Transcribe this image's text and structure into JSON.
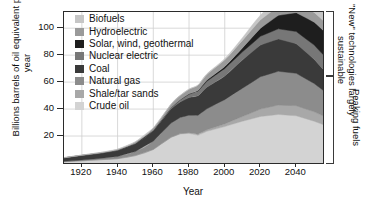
{
  "chart_data": {
    "type": "area",
    "stacked": true,
    "title": "",
    "xlabel": "Year",
    "ylabel": "Billions barrels of oil equivalent per year",
    "xlim": [
      1910,
      2055
    ],
    "ylim": [
      0,
      112
    ],
    "xticks": [
      1920,
      1940,
      1960,
      1980,
      2000,
      2020,
      2040
    ],
    "yticks": [
      20,
      40,
      60,
      80,
      100
    ],
    "grid": true,
    "legend_position": "inside-top-left",
    "x": [
      1910,
      1920,
      1930,
      1940,
      1950,
      1960,
      1970,
      1975,
      1980,
      1985,
      1990,
      2000,
      2010,
      2020,
      2030,
      2040,
      2050,
      2055
    ],
    "series": [
      {
        "name": "Crude oil",
        "color": "#d3d3d3",
        "values": [
          1.0,
          1.6,
          2.4,
          3.2,
          5.5,
          10.0,
          19.0,
          21.5,
          22.0,
          20.5,
          23.5,
          27.0,
          31.0,
          34.5,
          36.0,
          35.0,
          31.0,
          28.5
        ]
      },
      {
        "name": "Shale/tar sands",
        "color": "#a8a8a8",
        "values": [
          0.0,
          0.0,
          0.0,
          0.0,
          0.0,
          0.1,
          0.2,
          0.3,
          0.5,
          0.8,
          1.2,
          2.0,
          3.5,
          5.5,
          7.0,
          7.5,
          7.0,
          6.5
        ]
      },
      {
        "name": "Natural gas",
        "color": "#8c8c8c",
        "values": [
          0.3,
          0.6,
          1.0,
          1.6,
          3.0,
          6.0,
          10.5,
          12.0,
          13.0,
          14.0,
          15.5,
          18.0,
          21.0,
          24.0,
          25.0,
          24.0,
          21.0,
          19.0
        ]
      },
      {
        "name": "Coal",
        "color": "#3a3a3a",
        "values": [
          2.5,
          3.4,
          3.8,
          4.6,
          6.0,
          8.0,
          10.5,
          11.5,
          13.0,
          14.5,
          16.0,
          17.5,
          21.0,
          23.5,
          24.0,
          22.0,
          18.0,
          15.5
        ]
      },
      {
        "name": "Nuclear electric",
        "color": "#777777",
        "values": [
          0.0,
          0.0,
          0.0,
          0.0,
          0.0,
          0.1,
          0.8,
          1.5,
          2.5,
          3.5,
          4.5,
          5.5,
          6.0,
          6.5,
          7.5,
          9.0,
          10.5,
          11.0
        ]
      },
      {
        "name": "Solar, wind, geothermal",
        "color": "#1e1e1e",
        "values": [
          0.0,
          0.0,
          0.0,
          0.0,
          0.0,
          0.0,
          0.1,
          0.2,
          0.3,
          0.5,
          0.8,
          1.5,
          3.0,
          6.0,
          10.0,
          14.0,
          17.0,
          18.0
        ]
      },
      {
        "name": "Hydroelectric",
        "color": "#9a9a9a",
        "values": [
          0.2,
          0.3,
          0.5,
          0.8,
          1.2,
          1.8,
          2.6,
          3.0,
          3.4,
          3.8,
          4.2,
          5.0,
          5.6,
          6.2,
          6.6,
          7.0,
          7.2,
          7.3
        ]
      },
      {
        "name": "Biofuels",
        "color": "#c6c6c6",
        "values": [
          0.0,
          0.0,
          0.0,
          0.0,
          0.0,
          0.0,
          0.0,
          0.1,
          0.2,
          0.3,
          0.5,
          1.0,
          2.0,
          3.5,
          5.0,
          6.0,
          6.5,
          6.8
        ]
      }
    ]
  },
  "legend": {
    "items": [
      {
        "label": "Biofuels",
        "color": "#c6c6c6"
      },
      {
        "label": "Hydroelectric",
        "color": "#9a9a9a"
      },
      {
        "label": "Solar, wind, geothermal",
        "color": "#1e1e1e"
      },
      {
        "label": "Nuclear electric",
        "color": "#777777"
      },
      {
        "label": "Coal",
        "color": "#3a3a3a"
      },
      {
        "label": "Natural gas",
        "color": "#8c8c8c"
      },
      {
        "label": "Shale/tar sands",
        "color": "#a8a8a8"
      },
      {
        "label": "Crude oil",
        "color": "#d3d3d3"
      }
    ]
  },
  "annotations": {
    "top_bracket": "\"New\" technologies largely sustainable",
    "bottom_bracket": "Peaking fuels"
  }
}
